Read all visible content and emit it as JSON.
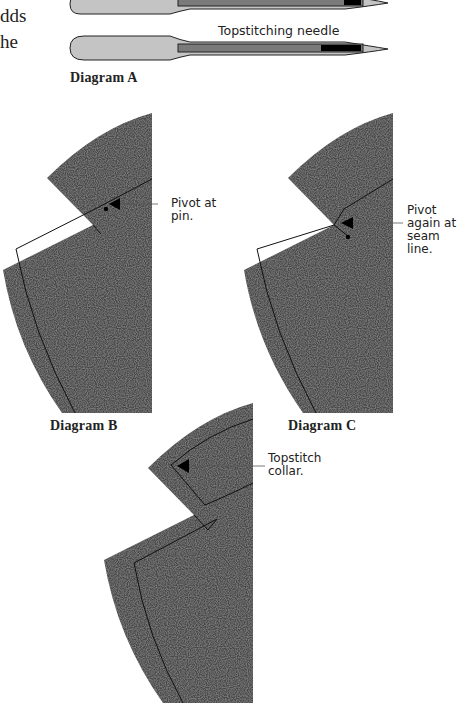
{
  "body_text_fragments": [
    "dds",
    "he"
  ],
  "diagram_a": {
    "caption": "Diagram A",
    "needle_label": "Topstitching needle",
    "colors": {
      "shank": "#c4c4c4",
      "groove": "#7a7a7a",
      "eye": "#000000",
      "outline": "#222222"
    }
  },
  "diagram_b": {
    "caption": "Diagram B",
    "callout": [
      "Pivot at",
      "pin."
    ]
  },
  "diagram_c": {
    "caption": "Diagram C",
    "callout": [
      "Pivot",
      "again at",
      "seam line."
    ]
  },
  "diagram_d": {
    "callout": [
      "Topstitch",
      "collar."
    ]
  },
  "colors": {
    "fabric": "#4a4a4a",
    "stitch_line": "#111111",
    "arrow": "#000000",
    "leader": "#555555"
  }
}
